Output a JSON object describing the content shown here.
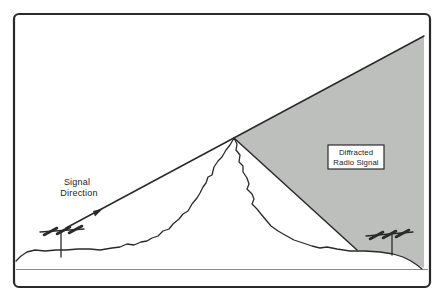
{
  "figure": {
    "colors": {
      "background": "#ffffff",
      "frame_border": "#2a2a2a",
      "line": "#2a2a2a",
      "shaded_region": "#bdbfbd",
      "callout_fill": "#ffffff",
      "baseline": "#8a8a8a"
    },
    "labels": {
      "signal_direction": {
        "line1": "Signal",
        "line2": "Direction"
      },
      "diffracted_box": {
        "line1": "Diffracted",
        "line2": "Radio Signal"
      }
    },
    "icons": {
      "left_antenna": "yagi-antenna-icon",
      "right_antenna": "yagi-antenna-icon",
      "arrowhead": "signal-direction-arrowhead-icon"
    }
  }
}
